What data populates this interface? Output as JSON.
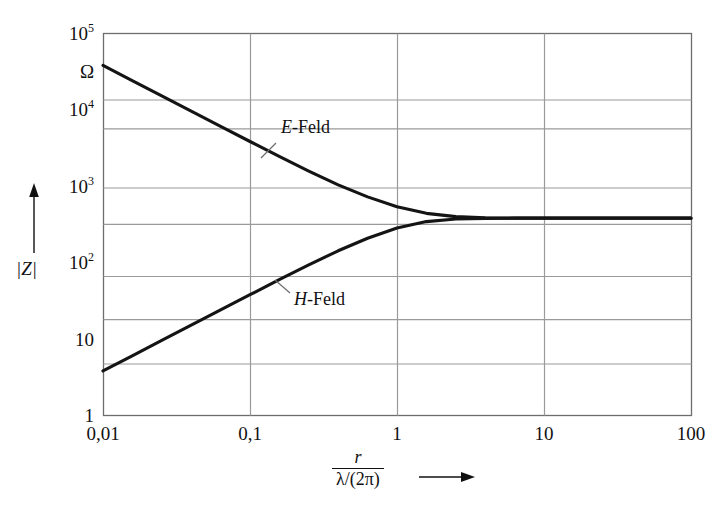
{
  "chart_data": {
    "type": "line",
    "title": "",
    "subtitle": "",
    "scale": {
      "x": "log",
      "y": "log"
    },
    "xlabel_numerator": "r",
    "xlabel_denominator": "λ/(2π)",
    "xlabel_arrow": "→",
    "ylabel": "|Z|",
    "ylabel_arrow": "↑",
    "yunit": "Ω",
    "grid": true,
    "legend_position": "inline-annotations",
    "xlim": [
      0.01,
      100
    ],
    "ylim": [
      1,
      100000
    ],
    "xticks": [
      "0,01",
      "0,1",
      "1",
      "10",
      "100"
    ],
    "xtick_values": [
      0.01,
      0.1,
      1,
      10,
      100
    ],
    "yticks": [
      "1",
      "10",
      "10²",
      "10³",
      "10⁴",
      "10⁵"
    ],
    "ytick_values": [
      1,
      10,
      100,
      1000,
      10000,
      100000
    ],
    "asymptote_value": 377,
    "series": [
      {
        "name": "E-Feld",
        "label": "E-Feld",
        "label_symbol": "E",
        "label_suffix": "-Feld",
        "x": [
          0.01,
          0.0158,
          0.0251,
          0.0398,
          0.0631,
          0.1,
          0.158,
          0.251,
          0.398,
          0.631,
          1.0,
          1.585,
          2.512,
          3.981,
          6.31,
          10.0,
          25.0,
          63.0,
          100.0
        ],
        "y": [
          37700,
          23800,
          15000,
          9480,
          6000,
          3800,
          2420,
          1560,
          1030,
          716,
          533,
          436,
          395,
          380,
          377,
          377,
          377,
          377,
          377
        ]
      },
      {
        "name": "H-Feld",
        "label": "H-Feld",
        "label_symbol": "H",
        "label_suffix": "-Feld",
        "x": [
          0.01,
          0.0158,
          0.0251,
          0.0398,
          0.0631,
          0.1,
          0.158,
          0.251,
          0.398,
          0.631,
          1.0,
          1.585,
          2.512,
          3.981,
          6.31,
          10.0,
          25.0,
          63.0,
          100.0
        ],
        "y": [
          3.77,
          5.96,
          9.45,
          15.0,
          23.7,
          37.5,
          59.1,
          92.3,
          141.0,
          206.0,
          281.0,
          340.0,
          367.0,
          375.0,
          377.0,
          377.0,
          377.0,
          377.0,
          377.0
        ]
      }
    ]
  },
  "colors": {
    "curve": "#141414",
    "grid": "#9a9a9a",
    "frame": "#6d6d6d",
    "text": "#111111",
    "background": "#ffffff"
  },
  "annotations": [
    {
      "name": "e-feld-annotation",
      "text": "E-Feld"
    },
    {
      "name": "h-feld-annotation",
      "text": "H-Feld"
    }
  ]
}
